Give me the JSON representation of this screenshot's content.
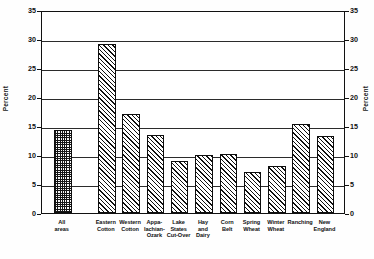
{
  "chart_data": {
    "type": "bar",
    "title": "",
    "subtitle": "",
    "xlabel": "",
    "ylabel": "Percent",
    "y2label": "Percent",
    "ylim": [
      0,
      35
    ],
    "yticks": [
      0,
      5,
      10,
      15,
      20,
      25,
      30,
      35
    ],
    "ytick_labels": [
      "0",
      "5",
      "10",
      "15",
      "20",
      "25",
      "30",
      "35"
    ],
    "grid": true,
    "grid_axis": "y",
    "legend": "none",
    "categories": [
      "All areas",
      "Eastern Cotton",
      "Western Cotton",
      "Appalachian-Ozark",
      "Lake States Cut-Over",
      "Hay and Dairy",
      "Corn Belt",
      "Spring Wheat",
      "Winter Wheat",
      "Ranching",
      "New England"
    ],
    "category_lines": [
      [
        "All",
        "areas"
      ],
      [
        "Eastern",
        "Cotton"
      ],
      [
        "Western",
        "Cotton"
      ],
      [
        "Appa-",
        "lachian-",
        "Ozark"
      ],
      [
        "Lake",
        "States",
        "Cut-Over"
      ],
      [
        "Hay",
        "and",
        "Dairy"
      ],
      [
        "Corn",
        "Belt"
      ],
      [
        "Spring",
        "Wheat"
      ],
      [
        "Winter",
        "Wheat"
      ],
      [
        "Ranching"
      ],
      [
        "New",
        "England"
      ]
    ],
    "values": [
      14.3,
      29.2,
      17.0,
      13.5,
      8.9,
      10.0,
      10.1,
      7.0,
      8.1,
      15.4,
      13.3
    ],
    "fills": [
      "checker",
      "diagonal-hatch",
      "diagonal-hatch",
      "diagonal-hatch",
      "diagonal-hatch",
      "diagonal-hatch",
      "diagonal-hatch",
      "diagonal-hatch",
      "diagonal-hatch",
      "diagonal-hatch",
      "diagonal-hatch"
    ],
    "colors": {
      "ink": "#111111",
      "bar_fill": "#ffffff",
      "background": "#ffffff"
    }
  }
}
